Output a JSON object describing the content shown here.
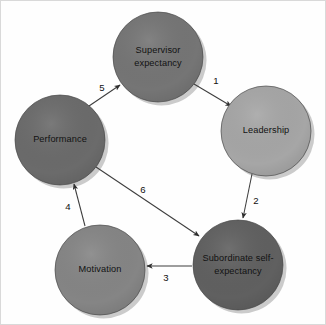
{
  "diagram": {
    "background_color": "#fefefe",
    "nodes": [
      {
        "id": "supervisor-expectancy",
        "label_line1": "Supervisor",
        "label_line2": "expectancy",
        "cx": 158,
        "cy": 57,
        "r": 45,
        "color": "#757575"
      },
      {
        "id": "leadership",
        "label_line1": "Leadership",
        "label_line2": "",
        "cx": 266,
        "cy": 131,
        "r": 45,
        "color": "#a6a6a6"
      },
      {
        "id": "performance",
        "label_line1": "Performance",
        "label_line2": "",
        "cx": 60,
        "cy": 140,
        "r": 45,
        "color": "#6b6b6b"
      },
      {
        "id": "motivation",
        "label_line1": "Motivation",
        "label_line2": "",
        "cx": 100,
        "cy": 270,
        "r": 45,
        "color": "#858585"
      },
      {
        "id": "subordinate-self-expectancy",
        "label_line1": "Subordinate self-",
        "label_line2": "expectancy",
        "cx": 238,
        "cy": 265,
        "r": 45,
        "color": "#606060"
      }
    ],
    "edges": [
      {
        "id": "edge-1",
        "label": "1",
        "from": "supervisor-expectancy",
        "to": "leadership",
        "x1": 194,
        "y1": 84,
        "x2": 231,
        "y2": 106,
        "label_x": 216,
        "label_y": 81
      },
      {
        "id": "edge-2",
        "label": "2",
        "from": "leadership",
        "to": "subordinate-self-expectancy",
        "x1": 252,
        "y1": 174,
        "x2": 243,
        "y2": 218,
        "label_x": 256,
        "label_y": 201
      },
      {
        "id": "edge-3",
        "label": "3",
        "from": "subordinate-self-expectancy",
        "to": "motivation",
        "x1": 192,
        "y1": 266,
        "x2": 147,
        "y2": 266,
        "label_x": 166,
        "label_y": 278
      },
      {
        "id": "edge-4",
        "label": "4",
        "from": "motivation",
        "to": "performance",
        "x1": 85,
        "y1": 226,
        "x2": 74,
        "y2": 184,
        "label_x": 68,
        "label_y": 207
      },
      {
        "id": "edge-5",
        "label": "5",
        "from": "performance",
        "to": "supervisor-expectancy",
        "x1": 89,
        "y1": 106,
        "x2": 120,
        "y2": 85,
        "label_x": 102,
        "label_y": 88
      },
      {
        "id": "edge-6",
        "label": "6",
        "from": "performance",
        "to": "subordinate-self-expectancy",
        "x1": 96,
        "y1": 167,
        "x2": 199,
        "y2": 236,
        "label_x": 143,
        "label_y": 190
      }
    ]
  }
}
